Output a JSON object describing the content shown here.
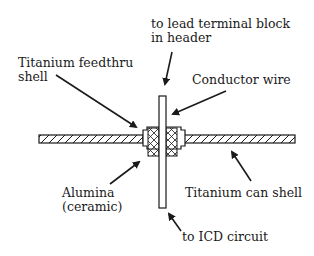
{
  "diagram": {
    "labels": {
      "lead_terminal_line1": "to lead terminal block",
      "lead_terminal_line2": "in header",
      "feedthru_shell_line1": "Titanium feedthru",
      "feedthru_shell_line2": "shell",
      "conductor_wire": "Conductor wire",
      "alumina_line1": "Alumina",
      "alumina_line2": "(ceramic)",
      "can_shell": "Titanium can shell",
      "icd_circuit": "to ICD circuit"
    },
    "colors": {
      "stroke": "#1a1a1a",
      "background": "#ffffff"
    }
  }
}
